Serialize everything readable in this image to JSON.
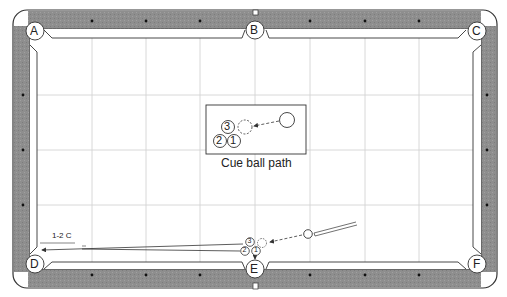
{
  "diagram": {
    "type": "pool-table-shot",
    "pockets": [
      {
        "id": "A",
        "label": "A"
      },
      {
        "id": "B",
        "label": "B"
      },
      {
        "id": "C",
        "label": "C"
      },
      {
        "id": "D",
        "label": "D"
      },
      {
        "id": "E",
        "label": "E"
      },
      {
        "id": "F",
        "label": "F"
      }
    ],
    "inset": {
      "caption": "Cue ball path",
      "balls": [
        {
          "number": "3"
        },
        {
          "number": "2"
        },
        {
          "number": "1"
        }
      ]
    },
    "table_balls": [
      {
        "number": "3"
      },
      {
        "number": "2"
      },
      {
        "number": "1"
      }
    ],
    "annotation": "1-2 C",
    "colors": {
      "rail": "#8a8a8a",
      "rail_border": "#333333",
      "grid": "#d4d4d4",
      "cloth": "#ffffff",
      "line": "#333333"
    }
  }
}
